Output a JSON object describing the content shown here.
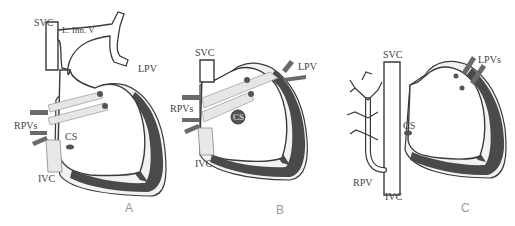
{
  "figure": {
    "panels": [
      {
        "id": "A",
        "label": "A",
        "structures": {
          "svc": "SVC",
          "l_inn_v": "L. Inn. V",
          "lpv": "LPV",
          "rpvs": "RPVs",
          "cs": "CS",
          "ivc": "IVC"
        }
      },
      {
        "id": "B",
        "label": "B",
        "structures": {
          "svc": "SVC",
          "lpv": "LPV",
          "rpvs": "RPVs",
          "cs": "CS",
          "ivc": "IVC"
        }
      },
      {
        "id": "C",
        "label": "C",
        "structures": {
          "svc": "SVC",
          "lpvs": "LPVs",
          "cs": "CS",
          "rpv": "RPV",
          "ivc": "IVC"
        }
      }
    ],
    "colors": {
      "outline": "#3a3a3a",
      "myocardium": "#4a4a4a",
      "vessel_fill": "#ffffff",
      "shaded_vessel": "#e6e6e6",
      "pulmonary_vein": "#6a6a6a",
      "label_text": "#444444",
      "panel_letter": "#9a9a9a"
    }
  }
}
